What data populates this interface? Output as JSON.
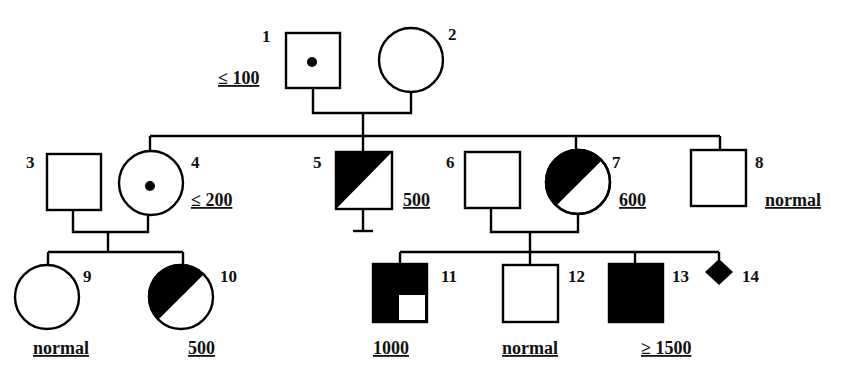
{
  "diagram": {
    "type": "pedigree",
    "individuals": [
      {
        "id": "1",
        "number": "1",
        "sex": "male",
        "status": "carrier-dot",
        "value": "≤ 100"
      },
      {
        "id": "2",
        "number": "2",
        "sex": "female",
        "status": "unaffected",
        "value": ""
      },
      {
        "id": "3",
        "number": "3",
        "sex": "male",
        "status": "unaffected",
        "value": ""
      },
      {
        "id": "4",
        "number": "4",
        "sex": "female",
        "status": "carrier-dot",
        "value": "≤ 200"
      },
      {
        "id": "5",
        "number": "5",
        "sex": "male",
        "status": "half-affected",
        "value": "500"
      },
      {
        "id": "6",
        "number": "6",
        "sex": "male",
        "status": "unaffected",
        "value": ""
      },
      {
        "id": "7",
        "number": "7",
        "sex": "female",
        "status": "half-affected",
        "value": "600"
      },
      {
        "id": "8",
        "number": "8",
        "sex": "male",
        "status": "unaffected",
        "value": "normal"
      },
      {
        "id": "9",
        "number": "9",
        "sex": "female",
        "status": "unaffected",
        "value": "normal"
      },
      {
        "id": "10",
        "number": "10",
        "sex": "female",
        "status": "half-affected",
        "value": "500"
      },
      {
        "id": "11",
        "number": "11",
        "sex": "male",
        "status": "three-quarter-affected",
        "value": "1000"
      },
      {
        "id": "12",
        "number": "12",
        "sex": "male",
        "status": "unaffected",
        "value": "normal"
      },
      {
        "id": "13",
        "number": "13",
        "sex": "male",
        "status": "affected",
        "value": "≥ 1500"
      },
      {
        "id": "14",
        "number": "14",
        "sex": "unknown",
        "status": "affected",
        "value": ""
      }
    ],
    "relationships": [
      {
        "partners": [
          "1",
          "2"
        ],
        "children": [
          "4",
          "5",
          "7",
          "8"
        ]
      },
      {
        "partners": [
          "3",
          "4"
        ],
        "children": [
          "9",
          "10"
        ]
      },
      {
        "partners": [
          "6",
          "7"
        ],
        "children": [
          "11",
          "12",
          "13",
          "14"
        ]
      }
    ],
    "notes": {
      "5": "no offspring (infertility bar)"
    }
  },
  "labels": {
    "n1": "1",
    "n2": "2",
    "n3": "3",
    "n4": "4",
    "n5": "5",
    "n6": "6",
    "n7": "7",
    "n8": "8",
    "n9": "9",
    "n10": "10",
    "n11": "11",
    "n12": "12",
    "n13": "13",
    "n14": "14",
    "v1": "≤ 100",
    "v4": "≤ 200",
    "v5": "500",
    "v7": "600",
    "v8": "normal",
    "v9": "normal",
    "v10": "500",
    "v11": "1000",
    "v12": "normal",
    "v13": "≥ 1500"
  }
}
